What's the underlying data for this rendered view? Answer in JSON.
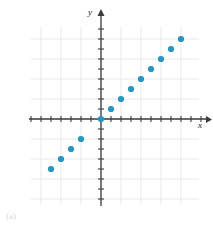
{
  "figure": {
    "caption": "(a)",
    "y_axis_label": "y",
    "x_axis_label": "x",
    "marker_color": "#2196c8",
    "axis_color": "#3b3b3b",
    "grid_color": "#e9e9ee"
  },
  "chart_data": {
    "type": "scatter",
    "title": "",
    "xlabel": "x",
    "ylabel": "y",
    "grid": true,
    "legend": null,
    "xlim": [
      -7,
      10
    ],
    "ylim": [
      -9,
      9
    ],
    "x_tick_step": 1,
    "y_tick_step": 1,
    "grid_step": 2,
    "points": [
      {
        "x": -5,
        "y": -5
      },
      {
        "x": -4,
        "y": -4
      },
      {
        "x": -3,
        "y": -3
      },
      {
        "x": -2,
        "y": -2
      },
      {
        "x": 0,
        "y": 0
      },
      {
        "x": 1,
        "y": 1
      },
      {
        "x": 2,
        "y": 2
      },
      {
        "x": 3,
        "y": 3
      },
      {
        "x": 4,
        "y": 4
      },
      {
        "x": 5,
        "y": 5
      },
      {
        "x": 6,
        "y": 6
      },
      {
        "x": 7,
        "y": 7
      },
      {
        "x": 8,
        "y": 8
      }
    ]
  }
}
